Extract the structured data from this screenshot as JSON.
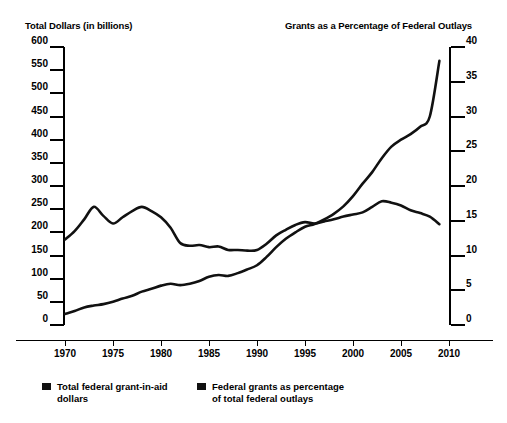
{
  "header": {
    "left_axis_title": "Total Dollars (in billions)",
    "right_axis_title": "Grants as a Percentage of Federal Outlays"
  },
  "scrollbar": {
    "name": "vertical-scrollbar"
  },
  "chart_data": {
    "type": "line",
    "title": "",
    "xlabel": "",
    "ylabel": "Total Dollars (in billions)",
    "y2label": "Grants as a Percentage of Federal Outlays",
    "xlim": [
      1970,
      2010
    ],
    "ylim": [
      0,
      600
    ],
    "y2lim": [
      0,
      40
    ],
    "grid": false,
    "legend_position": "bottom",
    "x_ticks": [
      "1970",
      "1975",
      "1980",
      "1985",
      "1990",
      "1995",
      "2000",
      "2005",
      "2010"
    ],
    "y_ticks": [
      "0",
      "50",
      "100",
      "150",
      "200",
      "250",
      "300",
      "350",
      "400",
      "450",
      "500",
      "550",
      "600"
    ],
    "y2_ticks": [
      "0",
      "5",
      "10",
      "15",
      "20",
      "25",
      "30",
      "35",
      "40"
    ],
    "x": [
      1970,
      1971,
      1972,
      1973,
      1974,
      1975,
      1976,
      1977,
      1978,
      1979,
      1980,
      1981,
      1982,
      1983,
      1984,
      1985,
      1986,
      1987,
      1988,
      1989,
      1990,
      1991,
      1992,
      1993,
      1994,
      1995,
      1996,
      1997,
      1998,
      1999,
      2000,
      2001,
      2002,
      2003,
      2004,
      2005,
      2006,
      2007,
      2008,
      2009
    ],
    "series": [
      {
        "name": "Total federal grant-in-aid dollars",
        "axis": "left",
        "units": "billions of dollars",
        "values": [
          24,
          30,
          38,
          42,
          45,
          50,
          57,
          63,
          72,
          78,
          85,
          89,
          86,
          89,
          95,
          104,
          108,
          106,
          112,
          120,
          129,
          147,
          168,
          186,
          200,
          212,
          218,
          228,
          240,
          256,
          278,
          305,
          330,
          360,
          385,
          400,
          412,
          428,
          450,
          570
        ]
      },
      {
        "name": "Federal grants as percentage of total federal outlays",
        "axis": "right",
        "units": "percent",
        "values": [
          12.3,
          13.5,
          15.2,
          17.0,
          15.7,
          14.6,
          15.5,
          16.4,
          17.0,
          16.4,
          15.5,
          14.0,
          11.8,
          11.4,
          11.5,
          11.2,
          11.3,
          10.8,
          10.8,
          10.7,
          10.8,
          11.7,
          12.9,
          13.7,
          14.4,
          14.8,
          14.6,
          14.9,
          15.2,
          15.6,
          15.9,
          16.2,
          17.0,
          17.8,
          17.6,
          17.2,
          16.5,
          16.1,
          15.6,
          14.5
        ]
      }
    ]
  },
  "legend": [
    {
      "label": "Total federal grant-in-aid\ndollars",
      "color": "#111111"
    },
    {
      "label": "Federal grants as percentage\nof total federal outlays",
      "color": "#111111"
    }
  ]
}
